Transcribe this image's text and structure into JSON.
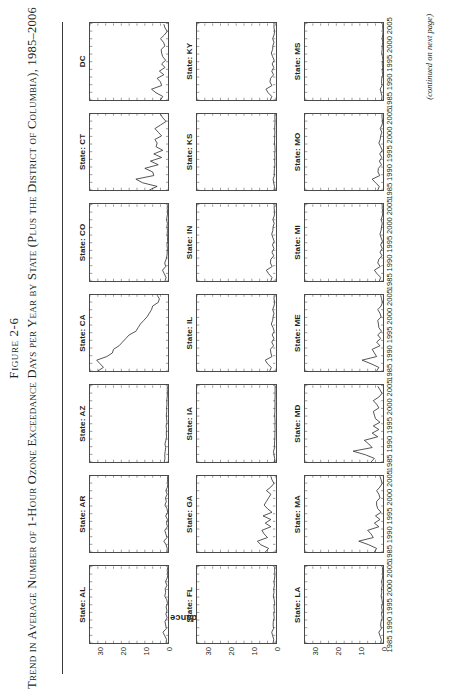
{
  "figure": {
    "number_label": "Figure 2-6",
    "title": "Trend in Average Number of 1-Hour Ozone Exceedance Days per Year by State (Plus the District of Columbia), 1985–2006",
    "continued_note": "(continued on next page)"
  },
  "axes": {
    "y_axis_label": "1-hour Exceedance Days per Year",
    "y_ticks": [
      "0",
      "10",
      "20",
      "30"
    ],
    "x_ticks": [
      "1985",
      "1990",
      "1995",
      "2000",
      "2005"
    ],
    "y_min": 0,
    "y_max": 35,
    "x_min": 1985,
    "x_max": 2006
  },
  "chart_data": {
    "type": "line",
    "title": "Trend in Average Number of 1-Hour Ozone Exceedance Days per Year by State (Plus the District of Columbia), 1985–2006",
    "xlabel": "",
    "ylabel": "1-hour Exceedance Days per Year",
    "xlim": [
      1985,
      2006
    ],
    "ylim": [
      0,
      35
    ],
    "grid": false,
    "legend": "none",
    "layout": "small-multiples 3 columns x 7 rows",
    "x": [
      1985,
      1986,
      1987,
      1988,
      1989,
      1990,
      1991,
      1992,
      1993,
      1994,
      1995,
      1996,
      1997,
      1998,
      1999,
      2000,
      2001,
      2002,
      2003,
      2004,
      2005,
      2006
    ],
    "panels": [
      {
        "label": "State: AL",
        "values": [
          1.0,
          0.8,
          1.6,
          2.4,
          0.9,
          1.2,
          1.5,
          0.5,
          1.1,
          0.6,
          1.0,
          0.4,
          0.7,
          1.6,
          1.2,
          1.4,
          0.6,
          1.3,
          0.5,
          0.2,
          0.5,
          0.3
        ]
      },
      {
        "label": "State: AR",
        "values": [
          0.6,
          0.5,
          1.0,
          2.0,
          0.6,
          1.1,
          1.6,
          0.4,
          0.8,
          0.4,
          1.2,
          0.3,
          0.6,
          1.5,
          0.9,
          1.3,
          0.5,
          1.1,
          0.4,
          0.2,
          0.4,
          0.3
        ]
      },
      {
        "label": "State: AZ",
        "values": [
          1.8,
          1.5,
          1.6,
          1.4,
          1.2,
          1.5,
          1.1,
          0.8,
          0.9,
          0.8,
          1.0,
          0.6,
          0.8,
          0.9,
          0.7,
          0.8,
          0.6,
          0.7,
          0.5,
          0.4,
          0.5,
          0.4
        ]
      },
      {
        "label": "State: CA",
        "values": [
          31.5,
          29.0,
          30.5,
          32.0,
          27.5,
          25.0,
          24.5,
          22.0,
          20.5,
          19.0,
          17.5,
          14.5,
          13.5,
          12.5,
          11.0,
          9.5,
          8.5,
          7.5,
          7.0,
          4.5,
          4.0,
          5.0
        ]
      },
      {
        "label": "State: CO",
        "values": [
          1.5,
          1.0,
          1.8,
          2.6,
          1.2,
          1.6,
          1.0,
          0.6,
          0.5,
          0.4,
          0.6,
          0.3,
          0.4,
          0.5,
          0.4,
          0.6,
          0.4,
          0.8,
          0.5,
          0.3,
          0.5,
          0.4
        ]
      },
      {
        "label": "State: CT",
        "values": [
          8.5,
          5.0,
          11.5,
          14.5,
          6.5,
          7.0,
          10.5,
          4.5,
          8.0,
          3.0,
          6.5,
          2.5,
          5.5,
          5.0,
          6.0,
          3.0,
          4.5,
          6.0,
          3.5,
          1.0,
          2.5,
          3.5
        ]
      },
      {
        "label": "DC",
        "values": [
          3.5,
          2.5,
          5.5,
          7.5,
          3.0,
          3.5,
          5.0,
          2.0,
          4.0,
          1.5,
          3.0,
          1.2,
          2.5,
          3.0,
          3.2,
          1.5,
          2.2,
          3.5,
          1.8,
          0.5,
          1.5,
          2.0
        ]
      },
      {
        "label": "State: FL",
        "values": [
          1.0,
          0.7,
          1.2,
          1.6,
          0.8,
          1.0,
          0.9,
          0.5,
          0.7,
          0.4,
          0.6,
          0.3,
          0.5,
          0.9,
          0.6,
          0.7,
          0.4,
          0.6,
          0.3,
          0.2,
          0.3,
          0.3
        ]
      },
      {
        "label": "State: GA",
        "values": [
          4.5,
          3.0,
          6.5,
          8.0,
          3.5,
          5.0,
          6.0,
          2.0,
          4.5,
          2.0,
          5.5,
          1.5,
          3.5,
          5.0,
          4.0,
          3.0,
          2.0,
          4.0,
          2.0,
          0.6,
          1.5,
          2.0
        ]
      },
      {
        "label": "State: IA",
        "values": [
          0.4,
          0.3,
          0.6,
          0.8,
          0.3,
          0.4,
          0.3,
          0.2,
          0.2,
          0.1,
          0.2,
          0.1,
          0.2,
          0.3,
          0.2,
          0.2,
          0.1,
          0.2,
          0.1,
          0.1,
          0.1,
          0.1
        ]
      },
      {
        "label": "State: IL",
        "values": [
          2.5,
          1.8,
          3.5,
          4.5,
          1.5,
          2.0,
          2.2,
          0.8,
          1.6,
          0.6,
          1.4,
          0.5,
          1.0,
          1.8,
          1.2,
          1.0,
          0.6,
          1.2,
          0.6,
          0.3,
          0.6,
          0.5
        ]
      },
      {
        "label": "State: IN",
        "values": [
          2.0,
          1.5,
          3.0,
          4.0,
          1.4,
          2.2,
          2.0,
          0.7,
          1.5,
          0.6,
          1.3,
          0.5,
          1.1,
          1.6,
          1.1,
          1.0,
          0.5,
          1.1,
          0.5,
          0.3,
          0.5,
          0.5
        ]
      },
      {
        "label": "State: KS",
        "values": [
          0.5,
          0.4,
          0.7,
          1.0,
          0.4,
          0.5,
          0.4,
          0.2,
          0.3,
          0.2,
          0.3,
          0.1,
          0.2,
          0.4,
          0.3,
          0.3,
          0.2,
          0.3,
          0.2,
          0.1,
          0.2,
          0.2
        ]
      },
      {
        "label": "State: KY",
        "values": [
          2.2,
          1.6,
          3.2,
          4.2,
          1.5,
          2.4,
          2.1,
          0.8,
          1.6,
          0.7,
          1.4,
          0.5,
          1.2,
          1.8,
          1.2,
          1.1,
          0.6,
          1.2,
          0.6,
          0.3,
          0.6,
          0.6
        ]
      },
      {
        "label": "State: LA",
        "values": [
          1.2,
          0.9,
          1.5,
          2.0,
          0.9,
          1.2,
          1.0,
          0.5,
          0.8,
          0.5,
          0.8,
          0.4,
          0.6,
          1.0,
          0.7,
          0.8,
          0.5,
          0.8,
          0.4,
          0.2,
          0.4,
          0.4
        ]
      },
      {
        "label": "State: MA",
        "values": [
          4.0,
          3.0,
          6.5,
          11.0,
          4.5,
          5.5,
          7.0,
          2.0,
          4.0,
          1.5,
          3.5,
          1.0,
          2.5,
          3.0,
          3.0,
          1.5,
          2.0,
          3.0,
          1.5,
          0.5,
          1.0,
          1.5
        ]
      },
      {
        "label": "State: MD",
        "values": [
          5.5,
          4.0,
          8.0,
          13.5,
          5.0,
          6.5,
          8.5,
          2.5,
          5.0,
          2.0,
          4.5,
          1.5,
          3.5,
          4.0,
          4.5,
          2.0,
          3.0,
          4.5,
          2.0,
          0.6,
          1.5,
          2.5
        ]
      },
      {
        "label": "State: ME",
        "values": [
          3.0,
          2.0,
          5.5,
          9.5,
          3.0,
          4.0,
          5.0,
          1.5,
          3.0,
          1.2,
          2.5,
          0.8,
          2.0,
          2.2,
          2.5,
          1.0,
          1.5,
          2.5,
          1.0,
          0.4,
          0.8,
          1.2
        ]
      },
      {
        "label": "State: MI",
        "values": [
          1.8,
          1.2,
          2.8,
          4.0,
          1.4,
          2.5,
          2.0,
          0.6,
          1.5,
          0.5,
          1.2,
          0.4,
          1.0,
          1.5,
          1.0,
          0.8,
          0.5,
          1.0,
          0.5,
          0.2,
          0.5,
          0.5
        ]
      },
      {
        "label": "State: MO",
        "values": [
          2.5,
          1.8,
          3.5,
          5.0,
          1.6,
          2.4,
          2.2,
          0.8,
          1.8,
          0.7,
          1.6,
          0.5,
          1.2,
          2.0,
          1.4,
          1.2,
          0.7,
          1.4,
          0.6,
          0.3,
          0.6,
          0.6
        ]
      },
      {
        "label": "State: MS",
        "values": [
          0.8,
          0.6,
          1.0,
          1.4,
          0.6,
          0.8,
          0.7,
          0.3,
          0.5,
          0.3,
          0.5,
          0.2,
          0.4,
          0.7,
          0.5,
          0.5,
          0.3,
          0.5,
          0.3,
          0.1,
          0.3,
          0.3
        ]
      }
    ]
  }
}
